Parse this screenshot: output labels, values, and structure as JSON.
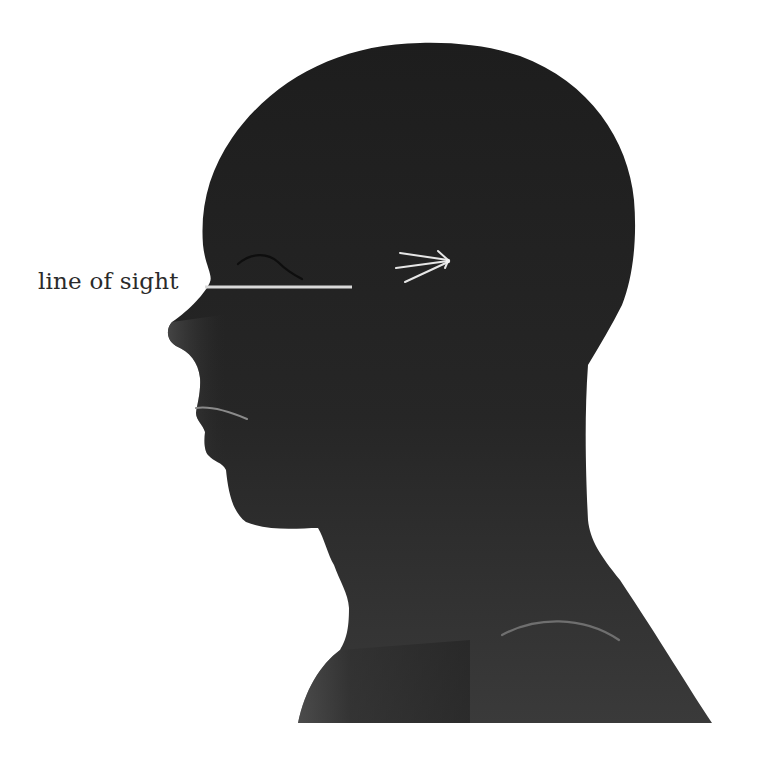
{
  "figure": {
    "facing": "left",
    "colors": {
      "background": "#ffffff",
      "silhouette_dark": "#1f1f1f",
      "silhouette_light": "#555555",
      "line_of_sight": "#d9d9d9",
      "accent_marks": "#8a8a8a",
      "brow_line": "#0e0e0e",
      "label_text": "#2a2a2a"
    },
    "annotations": [
      {
        "id": "line-of-sight",
        "label": "line of sight",
        "line": {
          "x1": 205,
          "y1": 287,
          "x2": 352,
          "y2": 287
        }
      }
    ],
    "markers": [
      {
        "id": "visual-focus-burst",
        "cx": 448,
        "cy": 261,
        "rays": 5
      }
    ]
  }
}
